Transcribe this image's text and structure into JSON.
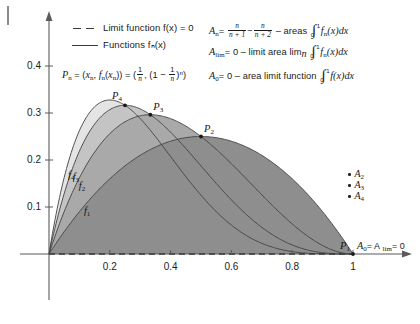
{
  "chart_data": {
    "type": "area",
    "title": "",
    "xlabel": "",
    "ylabel": "",
    "xlim": [
      0,
      1.12
    ],
    "ylim": [
      0,
      0.47
    ],
    "grid": false,
    "legend_position": "top-left",
    "x_ticks": [
      "0.2",
      "0.4",
      "0.6",
      "0.8",
      "1"
    ],
    "x_tick_values": [
      0.2,
      0.4,
      0.6,
      0.8,
      1.0
    ],
    "y_ticks": [
      "0.1",
      "0.2",
      "0.3",
      "0.4"
    ],
    "y_tick_values": [
      0.1,
      0.2,
      0.3,
      0.4
    ],
    "function_form": "f_n(x) = n*x*(1-x)^n",
    "limit_function": "f(x) = 0",
    "series": [
      {
        "name": "f_1",
        "n": 1,
        "label": "f",
        "label_sub": "1",
        "fill": "#8e8e8e",
        "peak_x": 0.5,
        "peak_y": 0.25,
        "point_label": "P",
        "point_sub": "1",
        "point_x": 1.0,
        "point_y": 0.0
      },
      {
        "name": "f_2",
        "n": 2,
        "label": "f",
        "label_sub": "2",
        "fill": "#a9a9a9",
        "peak_x": 0.3333,
        "peak_y": 0.2963,
        "point_label": "P",
        "point_sub": "2",
        "point_x": 0.5,
        "point_y": 0.25
      },
      {
        "name": "f_3",
        "n": 3,
        "label": "f",
        "label_sub": "3",
        "fill": "#c4c4c4",
        "peak_x": 0.25,
        "peak_y": 0.3164,
        "point_label": "P",
        "point_sub": "3",
        "point_x": 0.3333,
        "point_y": 0.2963
      },
      {
        "name": "f_4",
        "n": 4,
        "label": "f",
        "label_sub": "4",
        "fill": "#e4e4e4",
        "peak_x": 0.2,
        "peak_y": 0.3277,
        "point_label": "P",
        "point_sub": "4",
        "point_x": 0.25,
        "point_y": 0.3164
      }
    ],
    "points": [
      {
        "label": "P",
        "sub": "4",
        "x": 0.25,
        "y": 0.3164
      },
      {
        "label": "P",
        "sub": "3",
        "x": 0.3333,
        "y": 0.2963
      },
      {
        "label": "P",
        "sub": "2",
        "x": 0.5,
        "y": 0.25
      },
      {
        "label": "P",
        "sub": "1",
        "x": 1.0,
        "y": 0.0
      }
    ],
    "annotations": {
      "p1_note": "A",
      "p1_note_sub": "0",
      "p1_note_rest": "= A",
      "p1_note_sub2": "lim",
      "p1_note_end": "= 0"
    }
  },
  "legend": {
    "entries": [
      {
        "key": "dashed-line-key",
        "label": "Limit function f(x) = 0"
      },
      {
        "key": "solid-line-key",
        "label": "Functions fₙ(x)"
      }
    ]
  },
  "pn_formula": {
    "lhs": "P",
    "lhs_sub": "n",
    "eq1": "= (x",
    "x_sub": "n",
    "mid": ", f",
    "f_sub": "n",
    "mid2": "(x",
    "x_sub2": "n",
    "close": ")) = (",
    "frac_num": "1",
    "frac_den": "n",
    "comma": ", (1 −",
    "frac2_num": "1",
    "frac2_den": "n",
    "tail": ")",
    "power": "n",
    "endparen": ")"
  },
  "formulas": [
    {
      "name": "A_n",
      "lead": "A",
      "lead_sub": "n",
      "eq": "=",
      "frac1_num": "n",
      "frac1_den": "n + 1",
      "minus": "−",
      "frac2_num": "n",
      "frac2_den": "n + 2",
      "dash": "– areas",
      "int_lo": "0",
      "int_hi": "1",
      "integrand": "f",
      "integrand_sub": "n",
      "integrand_rest": "(x)dx"
    },
    {
      "name": "A_lim",
      "lead": "A",
      "lead_sub": "lim",
      "eq": "= 0 – limit area lim",
      "eq_sub": "n",
      "int_lo": "0",
      "int_hi": "1",
      "integrand": "f",
      "integrand_sub": "n",
      "integrand_rest": "(x)dx"
    },
    {
      "name": "A_0",
      "lead": "A",
      "lead_sub": "0",
      "eq": "= 0 – area limit function",
      "int_lo": "0",
      "int_hi": "1",
      "integrand": "f",
      "integrand_sub": "",
      "integrand_rest": "(x)dx"
    }
  ],
  "area_key": [
    {
      "label": "A",
      "sub": "2"
    },
    {
      "label": "A",
      "sub": "3"
    },
    {
      "label": "A",
      "sub": "4"
    }
  ],
  "colors": {
    "axis": "#5a5a5a",
    "curve": "#404040",
    "fill_1": "#8e8e8e",
    "fill_2": "#a9a9a9",
    "fill_3": "#c4c4c4",
    "fill_4": "#e4e4e4",
    "text": "#191919"
  }
}
